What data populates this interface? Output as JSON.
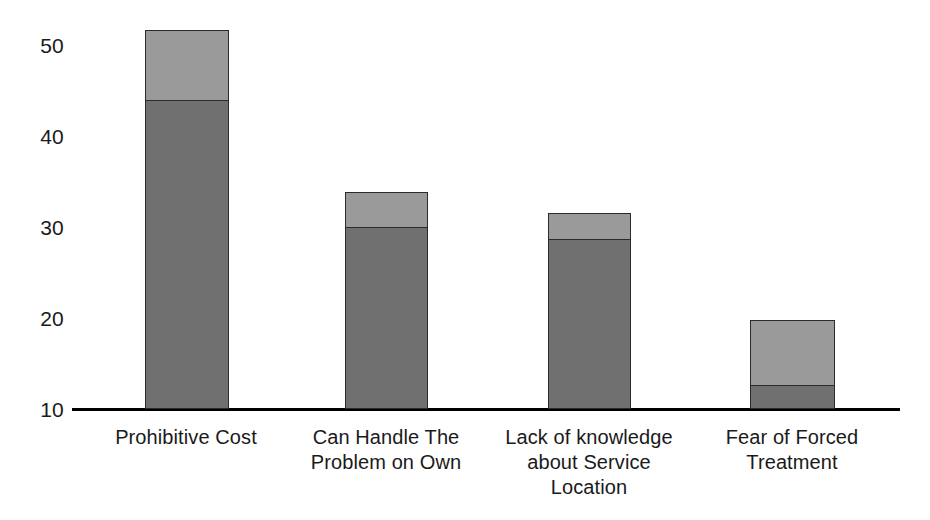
{
  "chart_data": {
    "type": "bar",
    "subtype": "stacked-bar",
    "title": "",
    "xlabel": "",
    "ylabel": "",
    "ylim": [
      10,
      52
    ],
    "y_ticks": [
      10,
      20,
      30,
      40,
      50
    ],
    "y_tick_labels": [
      "10",
      "20",
      "30",
      "40",
      "50"
    ],
    "grid": false,
    "legend": "none",
    "categories": [
      "Prohibitive Cost",
      "Can Handle The\nProblem on Own",
      "Lack of knowledge\nabout Service\nLocation",
      "Fear of Forced\nTreatment"
    ],
    "series": [
      {
        "name": "lower-segment",
        "color": "#707070",
        "values": [
          43.8,
          29.9,
          28.6,
          12.5
        ]
      },
      {
        "name": "upper-segment",
        "color": "#9a9a9a",
        "values": [
          7.8,
          4.0,
          2.9,
          7.3
        ]
      }
    ],
    "totals": [
      51.6,
      33.9,
      31.5,
      19.8
    ]
  },
  "axis": {
    "baseline_value": 10,
    "tick_labels": [
      "50",
      "40",
      "30",
      "20",
      "10"
    ],
    "tick_values": [
      50,
      40,
      30,
      20,
      10
    ]
  },
  "colors": {
    "segment_upper": "#9a9a9a",
    "segment_lower": "#707070",
    "bar_outline": "#2b2b2b",
    "axis": "#000000",
    "text": "#1a1a1a",
    "background": "#ffffff"
  },
  "bars": [
    {
      "category_label": "Prohibitive Cost",
      "center_x": 186,
      "left": 145,
      "width": 84,
      "total": 51.6,
      "lower": 43.8,
      "upper": 7.8
    },
    {
      "category_label": "Can Handle The\nProblem on Own",
      "center_x": 386,
      "left": 345,
      "width": 83,
      "total": 33.9,
      "lower": 29.9,
      "upper": 4.0
    },
    {
      "category_label": "Lack of knowledge\nabout Service\nLocation",
      "center_x": 589,
      "left": 548,
      "width": 83,
      "total": 31.5,
      "lower": 28.6,
      "upper": 2.9
    },
    {
      "category_label": "Fear of Forced\nTreatment",
      "center_x": 792,
      "left": 750,
      "width": 85,
      "total": 19.8,
      "lower": 12.5,
      "upper": 7.3
    }
  ]
}
